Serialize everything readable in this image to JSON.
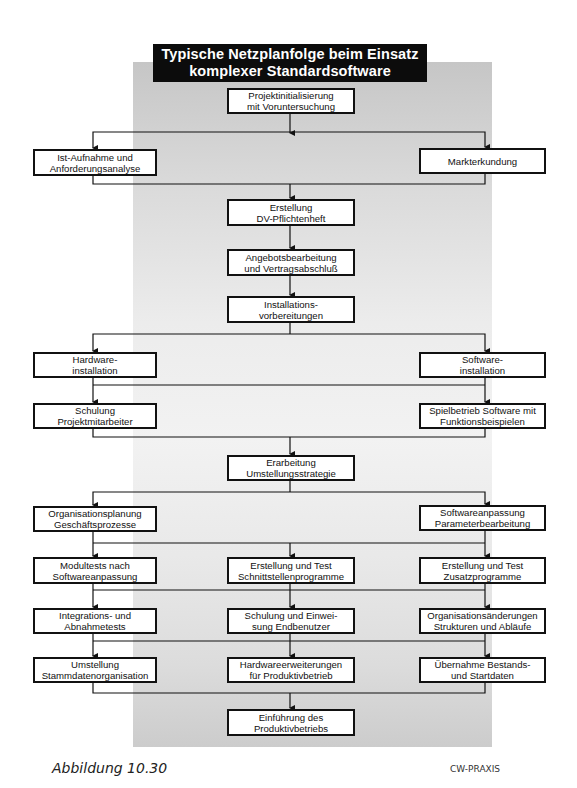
{
  "title": {
    "line1": "Typische Netzplanfolge beim Einsatz",
    "line2": "komplexer Standardsoftware"
  },
  "nodes": {
    "projektinit": [
      "Projektinitialisierung",
      "mit Voruntersuchung"
    ],
    "istaufnahme": [
      "Ist-Aufnahme und",
      "Anforderungsanalyse"
    ],
    "markterkundung": [
      "Markterkundung"
    ],
    "pflichtenheft": [
      "Erstellung",
      "DV-Pflichtenheft"
    ],
    "angebot": [
      "Angebotsbearbeitung",
      "und Vertragsabschluß"
    ],
    "installvorb": [
      "Installations-",
      "vorbereitungen"
    ],
    "hwinstall": [
      "Hardware-",
      "installation"
    ],
    "swinstall": [
      "Software-",
      "installation"
    ],
    "schulungpm": [
      "Schulung",
      "Projektmitarbeiter"
    ],
    "spielbetrieb": [
      "Spielbetrieb Software mit",
      "Funktionsbeispielen"
    ],
    "umstellungsstrategie": [
      "Erarbeitung",
      "Umstellungsstrategie"
    ],
    "orgplanung": [
      "Organisationsplanung",
      "Geschäftsprozesse"
    ],
    "swanpassung": [
      "Softwareanpassung",
      "Parameterbearbeitung"
    ],
    "modultests": [
      "Modultests nach",
      "Softwareanpassung"
    ],
    "schnittstellen": [
      "Erstellung und Test",
      "Schnittstellenprogramme"
    ],
    "zusatzprog": [
      "Erstellung und Test",
      "Zusatzprogramme"
    ],
    "integration": [
      "Integrations- und",
      "Abnahmetests"
    ],
    "schulungeb": [
      "Schulung und Einwei-",
      "sung Endbenutzer"
    ],
    "orgaenderung": [
      "Organisationsänderungen",
      "Strukturen und Abläufe"
    ],
    "stammdaten": [
      "Umstellung",
      "Stammdatenorganisation"
    ],
    "hwerweiterung": [
      "Hardwareerweiterungen",
      "für Produktivbetrieb"
    ],
    "uebernahme": [
      "Übernahme Bestands-",
      "und Startdaten"
    ],
    "einfuehrung": [
      "Einführung des",
      "Produktivbetriebs"
    ]
  },
  "footer": {
    "caption": "Abbildung 10.30",
    "brand": "CW-PRAXIS"
  },
  "colors": {
    "title_bg": "#0c0c0c",
    "line": "#111111",
    "panel_top": "#c6c6c6",
    "panel_mid": "#f2f2f2"
  }
}
